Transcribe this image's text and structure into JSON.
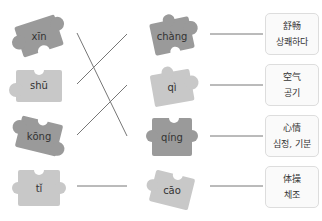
{
  "left_pieces": [
    {
      "pinyin": "xīn",
      "shade": "#9a9a9a"
    },
    {
      "pinyin": "shū",
      "shade": "#c8c8c8"
    },
    {
      "pinyin": "kōng",
      "shade": "#9a9a9a"
    },
    {
      "pinyin": "tǐ",
      "shade": "#c8c8c8"
    }
  ],
  "middle_pieces": [
    {
      "pinyin": "chàng",
      "shade": "#9a9a9a"
    },
    {
      "pinyin": "qì",
      "shade": "#c8c8c8"
    },
    {
      "pinyin": "qíng",
      "shade": "#9a9a9a"
    },
    {
      "pinyin": "cāo",
      "shade": "#c8c8c8"
    }
  ],
  "meanings": [
    {
      "chinese": "舒畅",
      "korean": "상쾌하다"
    },
    {
      "chinese": "空气",
      "korean": "공기"
    },
    {
      "chinese": "心情",
      "korean": "심정, 기분"
    },
    {
      "chinese": "体操",
      "korean": "체조"
    }
  ],
  "connections": [
    {
      "from": "xīn",
      "to": "qíng"
    },
    {
      "from": "shū",
      "to": "chàng"
    },
    {
      "from": "kōng",
      "to": "qì"
    },
    {
      "from": "tǐ",
      "to": "cāo"
    }
  ]
}
